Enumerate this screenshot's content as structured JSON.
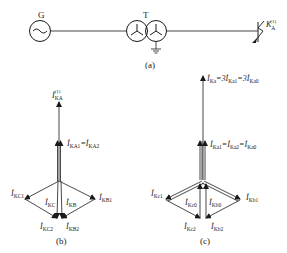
{
  "circuit": {
    "generator_label": "G",
    "transformer_label": "T",
    "fault_label": "K",
    "fault_sub": "A",
    "fault_sup": "(1)",
    "caption": "(a)"
  },
  "phasor_b": {
    "caption": "(b)",
    "labels": {
      "IKA": {
        "main": "İ",
        "sub": "KA",
        "sup": "(1)"
      },
      "IKA1": {
        "main": "İ",
        "sub": "KA1",
        "sup": "(1)",
        "eq": "=",
        "main2": "İ",
        "sub2": "KA2",
        "sup2": "(1)"
      },
      "IKC1": {
        "main": "İ",
        "sub": "KC1",
        "sup": "(1)"
      },
      "IKC": {
        "main": "İ",
        "sub": "KC",
        "sup": "(1)"
      },
      "IKB": {
        "main": "İ",
        "sub": "KB",
        "sup": "(1)"
      },
      "IKB1": {
        "main": "İ",
        "sub": "KB1",
        "sup": "(1)"
      },
      "IKC2": {
        "main": "İ",
        "sub": "KC2",
        "sup": "(1)"
      },
      "IKB2": {
        "main": "İ",
        "sub": "KB2",
        "sup": "(1)"
      }
    }
  },
  "phasor_c": {
    "caption": "(c)",
    "labels": {
      "top": {
        "t1": "İ",
        "s1": "Ka",
        "p1": "(1)",
        "eq1": "=3",
        "t2": "İ",
        "s2": "Ka1",
        "p2": "(1)",
        "eq2": "=3",
        "t3": "İ",
        "s3": "Ka0",
        "p3": "(1)"
      },
      "mid": {
        "t1": "İ",
        "s1": "Ka1",
        "p1": "(1)",
        "eq1": "=",
        "t2": "İ",
        "s2": "Ka2",
        "p2": "(1)",
        "eq2": "=",
        "t3": "İ",
        "s3": "Ka0",
        "p3": "(1)"
      },
      "Kc1": {
        "main": "İ",
        "sub": "Kc1",
        "sup": "(1)"
      },
      "Kc0": {
        "main": "İ",
        "sub": "Kc0",
        "sup": "(1)"
      },
      "Kb0": {
        "main": "İ",
        "sub": "Kb0",
        "sup": "(1)"
      },
      "Kb1": {
        "main": "İ",
        "sub": "Kb1",
        "sup": "(1)"
      },
      "Kc2": {
        "main": "İ",
        "sub": "Kc2",
        "sup": "(1)"
      },
      "Kb2": {
        "main": "İ",
        "sub": "Kb2",
        "sup": "(1)"
      }
    }
  }
}
